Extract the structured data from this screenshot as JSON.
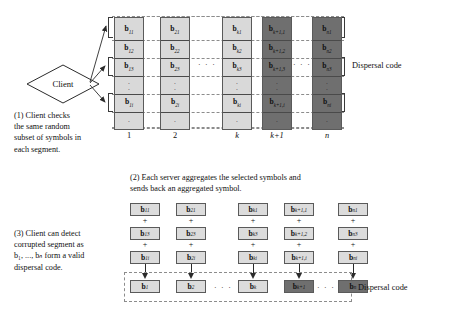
{
  "figure": {
    "colors": {
      "light_cell": "#d9d9d9",
      "dark_cell": "#6f6f6f",
      "cell_border": "#5a5a5a",
      "dashed_guide": "#8c8c8c",
      "arrow": "#2b2b2b",
      "text": "#111111",
      "background": "#ffffff"
    }
  },
  "client": {
    "label": "Client",
    "shape": "diamond",
    "arrow_count": 3
  },
  "captions": {
    "step1": "(1) Client checks the same random subset of symbols in each segment.",
    "step1_lines": [
      "(1) Client checks",
      "the same random",
      "subset of symbols in",
      "each segment."
    ],
    "step2": "(2) Each server aggregates the selected symbols and sends back an aggregated symbol.",
    "step2_lines": [
      "(2) Each server aggregates the selected symbols and",
      "sends back an aggregated symbol."
    ],
    "step3_lines": [
      "(3) Client can detect",
      "corrupted segment as",
      "b₁, ..., bₙ form a valid",
      "dispersal code."
    ]
  },
  "labels": {
    "dispersal_code_top": "Dispersal code",
    "dispersal_code_bottom": "Dispersal code",
    "ellipsis": "· · ·",
    "vertical_dot": "·",
    "plus": "+"
  },
  "top_panel": {
    "column_labels": [
      "1",
      "2",
      "k",
      "k+1",
      "n"
    ],
    "column_shades": [
      "light",
      "light",
      "light",
      "dark",
      "light_dark"
    ],
    "columns": [
      {
        "index": "1",
        "shade": "light",
        "cells": [
          {
            "base": "b",
            "sub": "11"
          },
          {
            "base": "b",
            "sub": "12"
          },
          {
            "base": "b",
            "sub": "13"
          },
          {
            "base": "",
            "sub": ""
          },
          {
            "base": "b",
            "sub": "1i"
          },
          {
            "base": "",
            "sub": ""
          }
        ]
      },
      {
        "index": "2",
        "shade": "light",
        "cells": [
          {
            "base": "b",
            "sub": "21"
          },
          {
            "base": "b",
            "sub": "22"
          },
          {
            "base": "b",
            "sub": "23"
          },
          {
            "base": "",
            "sub": ""
          },
          {
            "base": "b",
            "sub": "2i"
          },
          {
            "base": "",
            "sub": ""
          }
        ]
      },
      {
        "index": "k",
        "shade": "light",
        "cells": [
          {
            "base": "b",
            "sub": "k1"
          },
          {
            "base": "b",
            "sub": "k2"
          },
          {
            "base": "b",
            "sub": "k3"
          },
          {
            "base": "",
            "sub": ""
          },
          {
            "base": "b",
            "sub": "ki"
          },
          {
            "base": "",
            "sub": ""
          }
        ]
      },
      {
        "index": "k+1",
        "shade": "dark",
        "cells": [
          {
            "base": "b",
            "sub": "k+1,1"
          },
          {
            "base": "b",
            "sub": "k+1,2"
          },
          {
            "base": "b",
            "sub": "k+1,3"
          },
          {
            "base": "",
            "sub": ""
          },
          {
            "base": "b",
            "sub": "k+1,i"
          },
          {
            "base": "",
            "sub": ""
          }
        ]
      },
      {
        "index": "n",
        "shade": "dark",
        "cells": [
          {
            "base": "b",
            "sub": "n1"
          },
          {
            "base": "b",
            "sub": "n2"
          },
          {
            "base": "b",
            "sub": "n3"
          },
          {
            "base": "",
            "sub": ""
          },
          {
            "base": "b",
            "sub": "ni"
          },
          {
            "base": "",
            "sub": ""
          }
        ]
      }
    ],
    "selected_rows": [
      1,
      3,
      5
    ]
  },
  "bottom_panel": {
    "stacks": [
      {
        "terms": [
          {
            "base": "b",
            "sub": "11"
          },
          {
            "base": "b",
            "sub": "13"
          },
          {
            "base": "b",
            "sub": "1i"
          }
        ],
        "result": {
          "base": "b",
          "sub": "1"
        },
        "shade": "light"
      },
      {
        "terms": [
          {
            "base": "b",
            "sub": "21"
          },
          {
            "base": "b",
            "sub": "23"
          },
          {
            "base": "b",
            "sub": "2i"
          }
        ],
        "result": {
          "base": "b",
          "sub": "2"
        },
        "shade": "light"
      },
      {
        "terms": [
          {
            "base": "b",
            "sub": "k1"
          },
          {
            "base": "b",
            "sub": "k3"
          },
          {
            "base": "b",
            "sub": "ki"
          }
        ],
        "result": {
          "base": "b",
          "sub": "k"
        },
        "shade": "light"
      },
      {
        "terms": [
          {
            "base": "b",
            "sub": "k+1,1"
          },
          {
            "base": "b",
            "sub": "k+1,2"
          },
          {
            "base": "b",
            "sub": "k+1,i"
          }
        ],
        "result": {
          "base": "b",
          "sub": "k+1"
        },
        "shade": "dark"
      },
      {
        "terms": [
          {
            "base": "b",
            "sub": "n1"
          },
          {
            "base": "b",
            "sub": "n3"
          },
          {
            "base": "b",
            "sub": "ni"
          }
        ],
        "result": {
          "base": "b",
          "sub": "n"
        },
        "shade": "dark"
      }
    ]
  }
}
